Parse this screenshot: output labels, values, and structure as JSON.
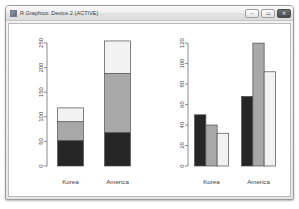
{
  "window": {
    "title": "R Graphics: Device 2 (ACTIVE)",
    "icon": "r-graphics-icon",
    "buttons": {
      "minimize": {
        "label": "–",
        "name": "minimize-button"
      },
      "maximize": {
        "label": "▭",
        "name": "maximize-button"
      },
      "close": {
        "label": "✕",
        "name": "close-button"
      }
    }
  },
  "colors": {
    "series_1": "#262626",
    "series_2": "#a8a8a8",
    "series_3": "#f2f2f2",
    "axis": "#707070",
    "canvas": "#ffffff",
    "window_frame": "#9a9a9a"
  },
  "chart_data": [
    {
      "type": "bar",
      "id": "stacked-barplot",
      "stacked": true,
      "title": "",
      "xlabel": "",
      "ylabel": "",
      "categories": [
        "Korea",
        "America"
      ],
      "yticks": [
        0,
        50,
        100,
        150,
        200,
        250
      ],
      "ylim": [
        0,
        260
      ],
      "grid": false,
      "legend": "none",
      "series": [
        {
          "name": "Series 1",
          "color": "#262626",
          "values": [
            52,
            68
          ]
        },
        {
          "name": "Series 2",
          "color": "#a8a8a8",
          "values": [
            38,
            120
          ]
        },
        {
          "name": "Series 3",
          "color": "#f2f2f2",
          "values": [
            28,
            66
          ]
        }
      ],
      "totals": [
        118,
        254
      ]
    },
    {
      "type": "bar",
      "id": "grouped-barplot",
      "stacked": false,
      "title": "",
      "xlabel": "",
      "ylabel": "",
      "categories": [
        "Korea",
        "America"
      ],
      "yticks": [
        0,
        20,
        40,
        60,
        80,
        100,
        120
      ],
      "ylim": [
        0,
        125
      ],
      "grid": false,
      "legend": "none",
      "series": [
        {
          "name": "Series 1",
          "color": "#262626",
          "values": [
            50,
            68
          ]
        },
        {
          "name": "Series 2",
          "color": "#a8a8a8",
          "values": [
            40,
            120
          ]
        },
        {
          "name": "Series 3",
          "color": "#f2f2f2",
          "values": [
            32,
            92
          ]
        }
      ]
    }
  ]
}
